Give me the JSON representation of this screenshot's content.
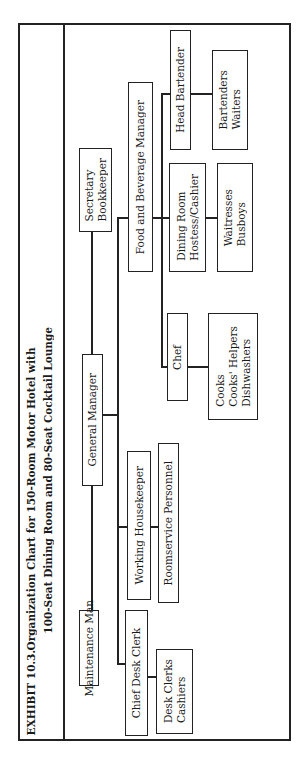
{
  "page_fragment": "...e-Based Sell",
  "exhibit": {
    "label": "EXHIBIT 10.3.",
    "title_line1": "Organization Chart for 150-Room Motor Hotel with",
    "title_line2": "100-Seat Dining Room and 80-Seat Cocktail Lounge"
  },
  "org_chart": {
    "root": "General Manager",
    "nodes": {
      "maintenance_man": "Maintenance Man",
      "general_manager": "General Manager",
      "secretary_bookkeeper": [
        "Secretary",
        "Bookkeeper"
      ],
      "chief_desk_clerk": "Chief Desk Clerk",
      "desk_clerks_cashiers": [
        "Desk Clerks",
        "Cashiers"
      ],
      "working_housekeeper": "Working Housekeeper",
      "roomservice_personnel": "Roomservice Personnel",
      "chef": "Chef",
      "cooks_group": [
        "Cooks",
        "Cooks' Helpers",
        "Dishwashers"
      ],
      "food_beverage_manager": "Food and Beverage Manager",
      "dining_room_hostess": [
        "Dining Room",
        "Hostess/Cashier"
      ],
      "waitresses_busboys": [
        "Waitresses",
        "Busboys"
      ],
      "head_bartender": "Head Bartender",
      "bartenders_waiters": [
        "Bartenders",
        "Waiters"
      ]
    },
    "edges": [
      [
        "Maintenance Man",
        "General Manager"
      ],
      [
        "General Manager",
        "Secretary/Bookkeeper"
      ],
      [
        "General Manager",
        "Chief Desk Clerk"
      ],
      [
        "General Manager",
        "Working Housekeeper"
      ],
      [
        "General Manager",
        "Food and Beverage Manager"
      ],
      [
        "Chief Desk Clerk",
        "Desk Clerks/Cashiers"
      ],
      [
        "Working Housekeeper",
        "Roomservice Personnel"
      ],
      [
        "Food and Beverage Manager",
        "Chef"
      ],
      [
        "Food and Beverage Manager",
        "Dining Room Hostess/Cashier"
      ],
      [
        "Food and Beverage Manager",
        "Head Bartender"
      ],
      [
        "Chef",
        "Cooks/Cooks' Helpers/Dishwashers"
      ],
      [
        "Dining Room Hostess/Cashier",
        "Waitresses/Busboys"
      ],
      [
        "Head Bartender",
        "Bartenders/Waiters"
      ]
    ]
  }
}
